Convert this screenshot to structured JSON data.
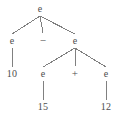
{
  "figure": {
    "kind": "parse-tree",
    "width": 117,
    "height": 117,
    "background_color": "#ffffff",
    "ink_color": "#4d4d4d",
    "edge_color": "#808080"
  },
  "nodes": [
    {
      "id": "n0",
      "label": "e",
      "type": "nonterminal",
      "x": 40,
      "y": 9,
      "row": 0
    },
    {
      "id": "n1",
      "label": "e",
      "type": "nonterminal",
      "x": 12,
      "y": 41,
      "row": 1
    },
    {
      "id": "n2",
      "label": "−",
      "type": "operator",
      "x": 43,
      "y": 40,
      "row": 1
    },
    {
      "id": "n3",
      "label": "e",
      "type": "nonterminal",
      "x": 75,
      "y": 41,
      "row": 1
    },
    {
      "id": "n4",
      "label": "10",
      "type": "terminal",
      "x": 12,
      "y": 74,
      "row": 2
    },
    {
      "id": "n5",
      "label": "e",
      "type": "nonterminal",
      "x": 43,
      "y": 74,
      "row": 2
    },
    {
      "id": "n6",
      "label": "+",
      "type": "operator",
      "x": 75,
      "y": 73,
      "row": 2
    },
    {
      "id": "n7",
      "label": "e",
      "type": "nonterminal",
      "x": 106,
      "y": 74,
      "row": 2
    },
    {
      "id": "n8",
      "label": "15",
      "type": "terminal",
      "x": 43,
      "y": 107,
      "row": 3
    },
    {
      "id": "n9",
      "label": "12",
      "type": "terminal",
      "x": 106,
      "y": 107,
      "row": 3
    }
  ],
  "edges": [
    {
      "from": "n0",
      "to": "n1"
    },
    {
      "from": "n0",
      "to": "n2"
    },
    {
      "from": "n0",
      "to": "n3"
    },
    {
      "from": "n1",
      "to": "n4"
    },
    {
      "from": "n3",
      "to": "n5"
    },
    {
      "from": "n3",
      "to": "n6"
    },
    {
      "from": "n3",
      "to": "n7"
    },
    {
      "from": "n5",
      "to": "n8"
    },
    {
      "from": "n7",
      "to": "n9"
    }
  ]
}
